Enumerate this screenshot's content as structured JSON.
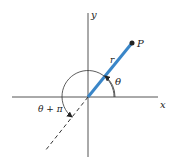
{
  "figure": {
    "type": "polar-coordinates-diagram",
    "axes": {
      "x_label": "x",
      "y_label": "y"
    },
    "point": {
      "label": "P"
    },
    "radius_label": "r",
    "angle_label": "θ",
    "opposite_angle_label": "θ + π",
    "colors": {
      "radius_line": "#3a86c8",
      "axes": "#555555",
      "text": "#222222"
    }
  }
}
